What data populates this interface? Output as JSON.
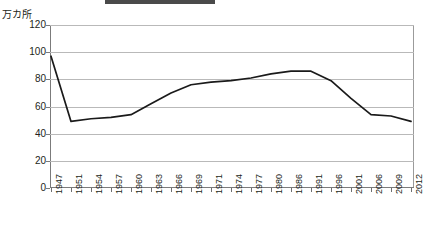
{
  "decor": {
    "top_bar_present": true,
    "top_bar_color": "#4a4a4a"
  },
  "axis": {
    "unit_label": "万カ所",
    "y_ticks": [
      120,
      100,
      80,
      60,
      40,
      20,
      0
    ],
    "y_min": 0,
    "y_max": 120,
    "line_color": "#1a1a1a",
    "grid_color": "#b9b9b9"
  },
  "chart_data": {
    "type": "line",
    "title": "",
    "xlabel": "",
    "ylabel": "万カ所",
    "ylim": [
      0,
      120
    ],
    "grid": true,
    "legend": "none",
    "categories": [
      "1947",
      "1951",
      "1954",
      "1957",
      "1960",
      "1963",
      "1966",
      "1969",
      "1971",
      "1974",
      "1977",
      "1980",
      "1986",
      "1991",
      "1996",
      "2001",
      "2006",
      "2009",
      "2012"
    ],
    "values": [
      97,
      49,
      51,
      52,
      54,
      62,
      70,
      76,
      78,
      79,
      81,
      84,
      86,
      86,
      79,
      66,
      54,
      53,
      49
    ],
    "series": [
      {
        "name": "箇所数",
        "values": [
          97,
          49,
          51,
          52,
          54,
          62,
          70,
          76,
          78,
          79,
          81,
          84,
          86,
          86,
          79,
          66,
          54,
          53,
          49
        ]
      }
    ]
  }
}
